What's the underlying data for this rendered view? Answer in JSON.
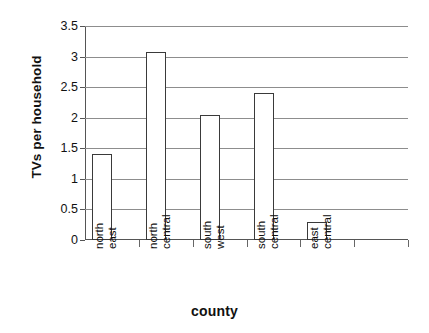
{
  "chart_data": {
    "type": "bar",
    "title": "",
    "xlabel": "county",
    "ylabel": "TVs per household",
    "categories": [
      "north east",
      "north central",
      "south west",
      "south central",
      "east central"
    ],
    "category_lines": [
      [
        "north",
        "east"
      ],
      [
        "north",
        "central"
      ],
      [
        "south",
        "west"
      ],
      [
        "south",
        "central"
      ],
      [
        "east",
        "central"
      ]
    ],
    "values": [
      1.4,
      3.08,
      2.05,
      2.4,
      0.3
    ],
    "ylim": [
      0,
      3.5
    ],
    "ytick_labels": [
      "0",
      "0.5",
      "1",
      "1.5",
      "2",
      "2.5",
      "3",
      "3.5"
    ],
    "ytick_values": [
      0,
      0.5,
      1,
      1.5,
      2,
      2.5,
      3,
      3.5
    ],
    "grid": true,
    "legend": "none",
    "bar_fill_color": "#ffffff",
    "bar_border_color": "#3a3a3a",
    "gridline_color": "#8d8d8d",
    "axis_color": "#555555",
    "background_color": "#ffffff",
    "empty_category_slots": 1
  }
}
